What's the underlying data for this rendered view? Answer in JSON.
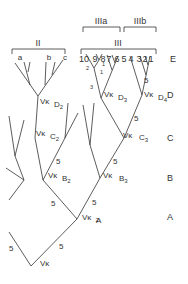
{
  "diagram": {
    "title_fragment": "y",
    "groups": {
      "II": "II",
      "III": "III",
      "IIIa": "IIIa",
      "IIIb": "IIIb",
      "sub_a": "a",
      "sub_b": "b",
      "sub_c": "c"
    },
    "leaves": [
      "10",
      "9",
      "8",
      "7",
      "6",
      "5",
      "4",
      "3",
      "2",
      "1"
    ],
    "levels": [
      "E",
      "D",
      "C",
      "B",
      "A"
    ],
    "nodes": {
      "vk": "Vκ",
      "A2": "A",
      "A2_sub": "2",
      "B2": "B",
      "B2_sub": "2",
      "B3": "B",
      "B3_sub": "3",
      "C2": "C",
      "C2_sub": "2",
      "C3": "C",
      "C3_sub": "3",
      "D2": "D",
      "D2_sub": "2",
      "D3": "D",
      "D3_sub": "3",
      "D4": "D",
      "D4_sub": "4"
    },
    "branch_labels": {
      "five": "5",
      "small_1": "1",
      "small_2": "2",
      "small_3": "3"
    }
  }
}
